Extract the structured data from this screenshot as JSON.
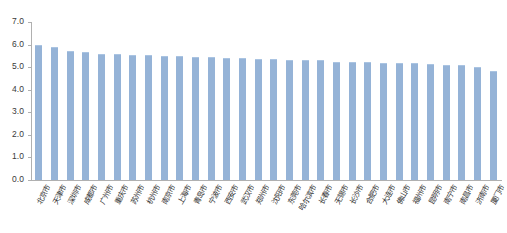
{
  "chart_data": {
    "type": "bar",
    "title": "",
    "subtitle": "",
    "xlabel": "",
    "ylabel": "",
    "ylim": [
      0.0,
      7.0
    ],
    "ytick_step": 1.0,
    "grid": false,
    "legend": "none",
    "bar_color": "#95b3d7",
    "axis_color": "#b0b0b0",
    "categories": [
      "北京市",
      "天津市",
      "深圳市",
      "成都市",
      "广州市",
      "重庆市",
      "苏州市",
      "杭州市",
      "南京市",
      "上海市",
      "青岛市",
      "宁波市",
      "西安市",
      "武汉市",
      "郑州市",
      "沈阳市",
      "东莞市",
      "哈尔滨市",
      "长春市",
      "无锡市",
      "长沙市",
      "合肥市",
      "大连市",
      "佛山市",
      "福州市",
      "昆明市",
      "南宁市",
      "南昌市",
      "济南市",
      "厦门市"
    ],
    "values": [
      6.0,
      5.9,
      5.7,
      5.65,
      5.6,
      5.6,
      5.55,
      5.55,
      5.5,
      5.5,
      5.45,
      5.45,
      5.4,
      5.4,
      5.35,
      5.35,
      5.3,
      5.3,
      5.3,
      5.25,
      5.25,
      5.25,
      5.2,
      5.2,
      5.2,
      5.15,
      5.1,
      5.1,
      5.0,
      4.85
    ],
    "ytick_labels": [
      "0.0",
      "1.0",
      "2.0",
      "3.0",
      "4.0",
      "5.0",
      "6.0",
      "7.0"
    ],
    "ytick_values": [
      0.0,
      1.0,
      2.0,
      3.0,
      4.0,
      5.0,
      6.0,
      7.0
    ]
  }
}
